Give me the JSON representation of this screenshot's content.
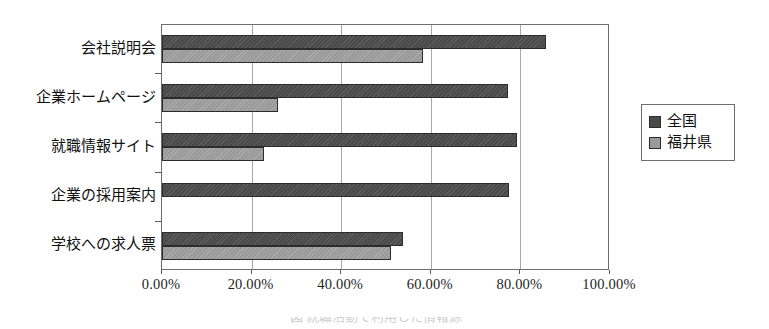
{
  "chart_data": {
    "type": "bar",
    "orientation": "horizontal",
    "title": "",
    "xlabel": "",
    "ylabel": "",
    "categories": [
      "会社説明会",
      "企業ホームページ",
      "就職情報サイト",
      "企業の採用案内",
      "学校への求人票"
    ],
    "series": [
      {
        "name": "全国",
        "color": "#4a4a4a",
        "values": [
          85.7,
          77.2,
          79.2,
          77.5,
          53.8
        ]
      },
      {
        "name": "福井県",
        "color": "#9a9a9a",
        "values": [
          58.3,
          25.9,
          22.8,
          0.0,
          51.1
        ]
      }
    ],
    "xlim": [
      0,
      100
    ],
    "xticks": [
      0,
      20,
      40,
      60,
      80,
      100
    ],
    "xtick_labels": [
      "0.00%",
      "20.00%",
      "40.00%",
      "60.00%",
      "80.00%",
      "100.00%"
    ],
    "grid": true,
    "grid_axis": "x",
    "legend_position": "right",
    "value_format": "percent"
  },
  "legend": {
    "items": [
      {
        "label": "全国",
        "swatch": "dark-gray-swatch"
      },
      {
        "label": "福井県",
        "swatch": "light-gray-swatch"
      }
    ]
  },
  "caption": {
    "text": "図 就職活動で利用した情報源"
  }
}
